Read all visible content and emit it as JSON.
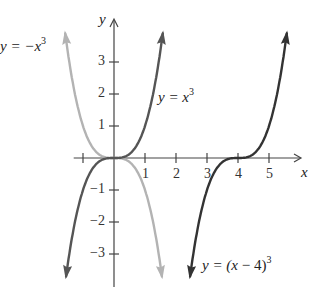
{
  "chart_data": {
    "type": "line",
    "title": "",
    "xlabel": "x",
    "ylabel": "y",
    "xlim": [
      -1.3,
      6
    ],
    "ylim": [
      -4,
      4.1
    ],
    "grid": false,
    "x_ticks": [
      -1,
      1,
      2,
      3,
      4,
      5
    ],
    "x_tick_labels": [
      "",
      "1",
      "2",
      "3",
      "4",
      "5"
    ],
    "y_ticks": [
      3,
      2,
      1,
      -1,
      -2,
      -3
    ],
    "y_tick_labels": [
      "3",
      "2",
      "1",
      "−1",
      "−2",
      "−3"
    ],
    "series": [
      {
        "name": "y = -x^3",
        "expr": "-x^3",
        "shift": 0,
        "sign": -1,
        "color": "#b3b3b3",
        "x_range": [
          -1.6,
          1.6
        ]
      },
      {
        "name": "y = x^3",
        "expr": "x^3",
        "shift": 0,
        "sign": 1,
        "color": "#555555",
        "x_range": [
          -1.6,
          1.6
        ]
      },
      {
        "name": "y = (x-4)^3",
        "expr": "(x-4)^3",
        "shift": 4,
        "sign": 1,
        "color": "#333333",
        "x_range": [
          2.4,
          5.6
        ]
      }
    ],
    "annotations": [
      {
        "text": "y = −x³",
        "x": -1.55,
        "y": 3.0
      },
      {
        "text": "y = x³",
        "x": 1.4,
        "y": 1.8
      },
      {
        "text": "y = (x − 4)³",
        "x": 2.8,
        "y": -3.5
      }
    ]
  },
  "labels": {
    "neg_cube": {
      "prefix": "y = −",
      "var": "x",
      "exp": "3"
    },
    "cube": {
      "prefix": "y = ",
      "var": "x",
      "exp": "3"
    },
    "shifted": {
      "prefix": "y = (",
      "var": "x",
      "mid": " − 4)",
      "exp": "3"
    },
    "x_axis": "x",
    "y_axis": "y"
  }
}
